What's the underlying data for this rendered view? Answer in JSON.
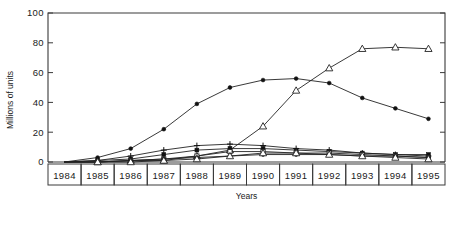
{
  "figure": {
    "title": "",
    "ylabel": "Millions of units",
    "xlabel": "Years"
  },
  "axis": {
    "y_ticks": [
      "0",
      "20",
      "40",
      "60",
      "80",
      "100"
    ],
    "x_categories": [
      "1984",
      "1985",
      "1986",
      "1987",
      "1988",
      "1989",
      "1990",
      "1991",
      "1992",
      "1993",
      "1994",
      "1995"
    ]
  },
  "chart_data": {
    "type": "line",
    "title": "",
    "xlabel": "Years",
    "ylabel": "Millions of units",
    "ylim": [
      0,
      100
    ],
    "xlim": [
      "1984",
      "1995"
    ],
    "grid": false,
    "legend": "none",
    "x": [
      "1984",
      "1985",
      "1986",
      "1987",
      "1988",
      "1989",
      "1990",
      "1991",
      "1992",
      "1993",
      "1994",
      "1995"
    ],
    "yticks": [
      0,
      20,
      40,
      60,
      80,
      100
    ],
    "series": [
      {
        "name": "series-filled-circle-peak",
        "marker": "filled-circle",
        "values": [
          0,
          3,
          9,
          22,
          39,
          50,
          55,
          56,
          53,
          43,
          36,
          29
        ]
      },
      {
        "name": "series-open-triangle-rising",
        "marker": "open-triangle",
        "values": [
          0,
          0,
          1,
          1,
          4,
          8,
          24,
          48,
          63,
          76,
          77,
          76
        ]
      },
      {
        "name": "series-plus-low",
        "marker": "plus",
        "values": [
          0,
          1,
          4,
          8,
          11,
          12,
          11,
          9,
          8,
          6,
          5,
          4
        ]
      },
      {
        "name": "series-filled-square-low",
        "marker": "filled-square",
        "values": [
          0,
          1,
          2,
          5,
          8,
          9,
          9,
          8,
          7,
          6,
          5,
          5
        ]
      },
      {
        "name": "series-open-square-low",
        "marker": "open-square",
        "values": [
          0,
          0,
          1,
          2,
          4,
          7,
          7,
          6,
          6,
          5,
          4,
          3
        ]
      },
      {
        "name": "series-filled-circle-low",
        "marker": "filled-circle",
        "values": [
          0,
          0,
          1,
          2,
          3,
          4,
          5,
          5,
          5,
          4,
          4,
          3
        ]
      },
      {
        "name": "series-open-triangle-low",
        "marker": "open-triangle",
        "values": [
          0,
          0,
          0,
          1,
          2,
          4,
          6,
          6,
          5,
          4,
          3,
          2
        ]
      }
    ]
  }
}
